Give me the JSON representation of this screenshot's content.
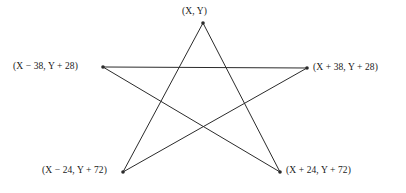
{
  "diagram": {
    "type": "pentagram",
    "stroke_color": "#2b2b2b",
    "background_color": "#ffffff",
    "stroke_width": 1,
    "vertices": [
      {
        "id": "top",
        "label": "(X, Y)",
        "x": 203,
        "y": 23,
        "offset_x": 0,
        "offset_y": 0
      },
      {
        "id": "left",
        "label": "(X − 38, Y + 28)",
        "x": 103,
        "y": 67,
        "offset_x": -38,
        "offset_y": 28
      },
      {
        "id": "right",
        "label": "(X + 38, Y + 28)",
        "x": 307,
        "y": 68,
        "offset_x": 38,
        "offset_y": 28
      },
      {
        "id": "bottom-left",
        "label": "(X − 24, Y + 72)",
        "x": 123,
        "y": 172,
        "offset_x": -24,
        "offset_y": 72
      },
      {
        "id": "bottom-right",
        "label": "(X + 24, Y + 72)",
        "x": 280,
        "y": 172,
        "offset_x": 24,
        "offset_y": 72
      }
    ],
    "edges": [
      {
        "from": "top",
        "to": "bottom-right"
      },
      {
        "from": "bottom-right",
        "to": "left"
      },
      {
        "from": "left",
        "to": "right"
      },
      {
        "from": "right",
        "to": "bottom-left"
      },
      {
        "from": "bottom-left",
        "to": "top"
      }
    ]
  }
}
